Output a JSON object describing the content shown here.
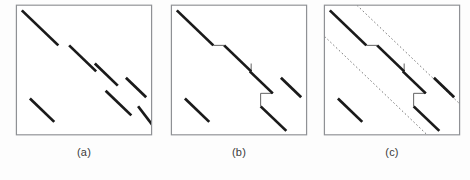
{
  "figure": {
    "background_color": "#fdfdfd",
    "panel_border_color": "#8f9195",
    "segment_color": "#1a1a1a",
    "connector_color": "#555555",
    "band_color": "#6d6d6d",
    "caption_color": "#3a3a3a",
    "width": 470,
    "height": 180
  },
  "chart_data": {
    "type": "line",
    "title": "",
    "xlabel": "",
    "ylabel": "",
    "panels": [
      {
        "id": "a",
        "caption": "(a)",
        "box": {
          "x": 0,
          "y": 0,
          "w": 100,
          "h": 100
        },
        "axis_range": {
          "xlim": [
            0,
            100
          ],
          "ylim": [
            0,
            100
          ]
        },
        "grid": false,
        "segments": [
          {
            "name": "segment-1",
            "x1": 4,
            "y1": 4,
            "x2": 31,
            "y2": 31
          },
          {
            "name": "segment-2",
            "x1": 39,
            "y1": 31,
            "x2": 59,
            "y2": 51
          },
          {
            "name": "segment-3",
            "x1": 58,
            "y1": 45,
            "x2": 75,
            "y2": 62
          },
          {
            "name": "segment-4",
            "x1": 66,
            "y1": 66,
            "x2": 85,
            "y2": 85
          },
          {
            "name": "segment-5",
            "x1": 81,
            "y1": 56,
            "x2": 96,
            "y2": 71
          },
          {
            "name": "segment-6",
            "x1": 90,
            "y1": 78,
            "x2": 101,
            "y2": 93
          },
          {
            "name": "segment-7",
            "x1": 10,
            "y1": 72,
            "x2": 28,
            "y2": 90
          }
        ],
        "connectors": [],
        "band_lines": []
      },
      {
        "id": "b",
        "caption": "(b)",
        "box": {
          "x": 0,
          "y": 0,
          "w": 100,
          "h": 100
        },
        "axis_range": {
          "xlim": [
            0,
            100
          ],
          "ylim": [
            0,
            100
          ]
        },
        "grid": false,
        "segments": [
          {
            "name": "segment-1",
            "x1": 4,
            "y1": 4,
            "x2": 31,
            "y2": 31
          },
          {
            "name": "segment-2",
            "x1": 39,
            "y1": 31,
            "x2": 59,
            "y2": 51
          },
          {
            "name": "segment-3",
            "x1": 58,
            "y1": 51,
            "x2": 75,
            "y2": 68
          },
          {
            "name": "segment-4",
            "x1": 66,
            "y1": 78,
            "x2": 85,
            "y2": 97
          },
          {
            "name": "segment-5",
            "x1": 81,
            "y1": 56,
            "x2": 96,
            "y2": 71
          },
          {
            "name": "segment-6",
            "x1": 10,
            "y1": 72,
            "x2": 28,
            "y2": 90
          }
        ],
        "connectors": [
          {
            "name": "connector-1",
            "x1": 31,
            "y1": 31,
            "x2": 39,
            "y2": 31
          },
          {
            "name": "connector-2",
            "x1": 59,
            "y1": 51,
            "x2": 58,
            "y2": 51
          },
          {
            "name": "connector-3",
            "x1": 75,
            "y1": 68,
            "x2": 66,
            "y2": 68
          },
          {
            "name": "connector-4",
            "x1": 66,
            "y1": 68,
            "x2": 66,
            "y2": 78
          },
          {
            "name": "connector-5",
            "x1": 59,
            "y1": 45,
            "x2": 59,
            "y2": 51
          }
        ],
        "band_lines": []
      },
      {
        "id": "c",
        "caption": "(c)",
        "box": {
          "x": 0,
          "y": 0,
          "w": 100,
          "h": 100
        },
        "axis_range": {
          "xlim": [
            0,
            100
          ],
          "ylim": [
            0,
            100
          ]
        },
        "grid": false,
        "segments": [
          {
            "name": "segment-1",
            "x1": 4,
            "y1": 4,
            "x2": 31,
            "y2": 31
          },
          {
            "name": "segment-2",
            "x1": 39,
            "y1": 31,
            "x2": 59,
            "y2": 51
          },
          {
            "name": "segment-3",
            "x1": 58,
            "y1": 51,
            "x2": 75,
            "y2": 68
          },
          {
            "name": "segment-4",
            "x1": 66,
            "y1": 78,
            "x2": 85,
            "y2": 97
          },
          {
            "name": "segment-5",
            "x1": 81,
            "y1": 56,
            "x2": 96,
            "y2": 71
          },
          {
            "name": "segment-6",
            "x1": 10,
            "y1": 72,
            "x2": 28,
            "y2": 90
          }
        ],
        "connectors": [
          {
            "name": "connector-1",
            "x1": 31,
            "y1": 31,
            "x2": 39,
            "y2": 31
          },
          {
            "name": "connector-2",
            "x1": 59,
            "y1": 51,
            "x2": 58,
            "y2": 51
          },
          {
            "name": "connector-3",
            "x1": 75,
            "y1": 68,
            "x2": 66,
            "y2": 68
          },
          {
            "name": "connector-4",
            "x1": 66,
            "y1": 68,
            "x2": 66,
            "y2": 78
          },
          {
            "name": "connector-5",
            "x1": 59,
            "y1": 45,
            "x2": 59,
            "y2": 51
          }
        ],
        "band_lines": [
          {
            "name": "band-line-upper",
            "x1": 22,
            "y1": -2,
            "x2": 104,
            "y2": 80
          },
          {
            "name": "band-line-lower",
            "x1": -2,
            "y1": 22,
            "x2": 80,
            "y2": 104
          }
        ]
      }
    ]
  }
}
